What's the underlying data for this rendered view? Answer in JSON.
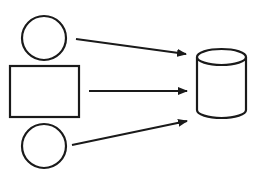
{
  "diagram": {
    "stroke_color": "#1a1a1a",
    "background_color": "#ffffff",
    "nodes": [
      {
        "id": "circle-top",
        "shape": "circle",
        "label": ""
      },
      {
        "id": "rectangle-middle",
        "shape": "rectangle",
        "label": ""
      },
      {
        "id": "circle-bottom",
        "shape": "circle",
        "label": ""
      },
      {
        "id": "database",
        "shape": "cylinder",
        "label": ""
      }
    ],
    "edges": [
      {
        "from": "circle-top",
        "to": "database",
        "type": "arrow"
      },
      {
        "from": "rectangle-middle",
        "to": "database",
        "type": "arrow"
      },
      {
        "from": "circle-bottom",
        "to": "database",
        "type": "arrow"
      }
    ]
  }
}
